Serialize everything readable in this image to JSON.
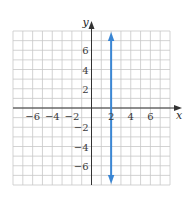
{
  "chart_data": {
    "type": "line",
    "title": "",
    "xlabel": "x",
    "ylabel": "y",
    "xlim": [
      -8,
      8
    ],
    "ylim": [
      -8,
      8
    ],
    "grid": true,
    "grid_step": 1,
    "x_ticks": [
      -6,
      -4,
      -2,
      2,
      4,
      6
    ],
    "y_ticks": [
      6,
      4,
      2,
      -2,
      -4,
      -6
    ],
    "x_tick_labels": [
      "−6",
      "−4",
      "−2",
      "2",
      "4",
      "6"
    ],
    "y_tick_labels": [
      "6",
      "4",
      "2",
      "−2",
      "−4",
      "−6"
    ],
    "series": [
      {
        "name": "x = 2",
        "kind": "vertical-line",
        "x": [
          2,
          2
        ],
        "y": [
          -7.8,
          7.8
        ],
        "arrows": "both",
        "color": "#3a86d4"
      }
    ],
    "legend": null
  },
  "colors": {
    "grid": "#c8c8c8",
    "axis": "#333333",
    "line": "#3a86d4",
    "background": "#ffffff"
  }
}
